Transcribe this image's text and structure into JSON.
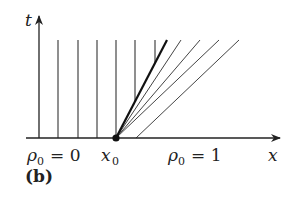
{
  "figure": {
    "panel_label": "(b)",
    "axis_x_label": "x",
    "axis_t_label": "t",
    "left_region_label": "ρ₀ = 0",
    "left_rho": "ρ",
    "left_sub": "0",
    "left_eq": "= 0",
    "origin_label": "x",
    "origin_sub": "0",
    "right_region_label": "ρ₀ = 1",
    "right_rho": "ρ",
    "right_sub": "0",
    "right_eq": "= 1",
    "colors": {
      "ink": "#222222",
      "background": "#ffffff"
    }
  },
  "geometry": {
    "axis_y": 138,
    "axis_x_start": 26,
    "axis_x_end": 280,
    "t_axis_x": 39,
    "t_axis_top": 16,
    "line_top": 40,
    "vertical_lines_x": [
      58,
      78,
      97,
      116,
      135,
      155
    ],
    "shock_start": [
      116,
      138
    ],
    "shock_end": [
      167,
      40
    ],
    "fan_lines": [
      {
        "start": [
          116,
          138
        ],
        "end": [
          181,
          40
        ]
      },
      {
        "start": [
          116,
          138
        ],
        "end": [
          200,
          40
        ]
      },
      {
        "start": [
          116,
          138
        ],
        "end": [
          219,
          40
        ]
      },
      {
        "start": [
          136,
          138
        ],
        "end": [
          239,
          40
        ]
      }
    ]
  }
}
